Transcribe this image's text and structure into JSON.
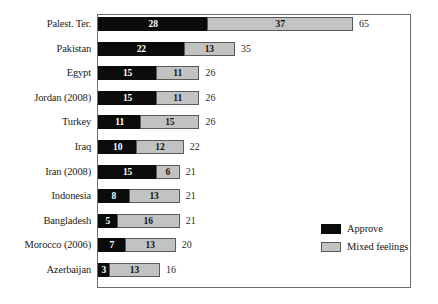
{
  "chart_data": {
    "type": "bar",
    "orientation": "horizontal",
    "stacked": true,
    "title": "",
    "subtitle": "",
    "xlabel": "",
    "ylabel": "",
    "xlim": [
      0,
      79
    ],
    "grid": false,
    "legend_position": "bottom-right",
    "categories": [
      "Palest. Ter.",
      "Pakistan",
      "Egypt",
      "Jordan (2008)",
      "Turkey",
      "Iraq",
      "Iran (2008)",
      "Indonesia",
      "Bangladesh",
      "Morocco (2006)",
      "Azerbaijan"
    ],
    "series": [
      {
        "name": "Approve",
        "color": "#0b0b0b",
        "values": [
          28,
          22,
          15,
          15,
          11,
          10,
          15,
          8,
          5,
          7,
          3
        ]
      },
      {
        "name": "Mixed feelings",
        "color": "#c2c2c2",
        "values": [
          37,
          13,
          11,
          11,
          15,
          12,
          6,
          13,
          16,
          13,
          13
        ]
      }
    ],
    "totals": [
      65,
      35,
      26,
      26,
      26,
      22,
      21,
      21,
      21,
      20,
      16
    ]
  },
  "legend": {
    "items": [
      {
        "label": "Approve",
        "color": "#0b0b0b"
      },
      {
        "label": "Mixed feelings",
        "color": "#c2c2c2"
      }
    ]
  },
  "style": {
    "approve_color": "#0b0b0b",
    "mixed_color": "#c2c2c2",
    "frame_color": "#6d6d6d",
    "background": "#ffffff",
    "px_per_unit": 3.94
  }
}
